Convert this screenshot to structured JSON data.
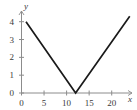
{
  "chart_data": {
    "type": "line",
    "title": "",
    "xlabel": "x",
    "ylabel": "y",
    "xlim": [
      0,
      24.5
    ],
    "ylim": [
      0,
      4.6
    ],
    "grid": false,
    "legend": null,
    "xticks": [
      0,
      5,
      10,
      15,
      20
    ],
    "yticks": [
      0,
      1,
      2,
      3,
      4
    ],
    "xtick_labels": [
      "0",
      "5",
      "10",
      "15",
      "20"
    ],
    "ytick_labels": [
      "0",
      "1",
      "2",
      "3",
      "4"
    ],
    "series": [
      {
        "name": "v-shaped piecewise linear",
        "x": [
          1,
          12,
          24
        ],
        "y": [
          4,
          0,
          4.3
        ],
        "color": "#1a1a1a",
        "style": "solid"
      }
    ],
    "annotations": [],
    "vertex": {
      "x": 12,
      "y": 0
    }
  },
  "axes": {
    "y_axis_name": "y",
    "x_axis_name": "x",
    "axis_color": "#8c8c8c",
    "curve_color": "#1a1a1a",
    "text_color": "#3a3a3a"
  },
  "ticks": {
    "x": [
      {
        "label": "0",
        "value": 0
      },
      {
        "label": "5",
        "value": 5
      },
      {
        "label": "10",
        "value": 10
      },
      {
        "label": "15",
        "value": 15
      },
      {
        "label": "20",
        "value": 20
      }
    ],
    "y": [
      {
        "label": "0",
        "value": 0
      },
      {
        "label": "1",
        "value": 1
      },
      {
        "label": "2",
        "value": 2
      },
      {
        "label": "3",
        "value": 3
      },
      {
        "label": "4",
        "value": 4
      }
    ]
  }
}
